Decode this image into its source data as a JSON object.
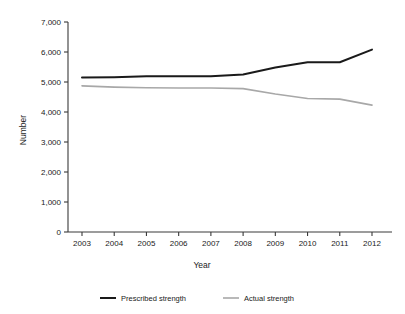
{
  "chart_data": {
    "type": "line",
    "title": "",
    "xlabel": "Year",
    "ylabel": "Number",
    "categories": [
      "2003",
      "2004",
      "2005",
      "2006",
      "2007",
      "2008",
      "2009",
      "2010",
      "2011",
      "2012"
    ],
    "x": [
      2003,
      2004,
      2005,
      2006,
      2007,
      2008,
      2009,
      2010,
      2011,
      2012
    ],
    "xlim": [
      2003,
      2012
    ],
    "ylim": [
      0,
      7000
    ],
    "yticks": [
      0,
      1000,
      2000,
      3000,
      4000,
      5000,
      6000,
      7000
    ],
    "ytick_labels": [
      "0",
      "1,000",
      "2,000",
      "3,000",
      "4,000",
      "5,000",
      "6,000",
      "7,000"
    ],
    "grid": false,
    "legend_position": "bottom-center",
    "series": [
      {
        "name": "Prescribed strength",
        "color": "#1a1a1a",
        "line_width": 2.0,
        "values": [
          5150,
          5160,
          5190,
          5190,
          5190,
          5250,
          5480,
          5660,
          5660,
          6080
        ]
      },
      {
        "name": "Actual strength",
        "color": "#a8a8a8",
        "line_width": 1.6,
        "values": [
          4870,
          4830,
          4810,
          4800,
          4800,
          4780,
          4600,
          4450,
          4430,
          4230
        ]
      }
    ]
  },
  "axes": {
    "y_title": "Number",
    "x_title": "Year"
  },
  "legend": {
    "items": [
      {
        "label": "Prescribed strength",
        "color": "#1a1a1a"
      },
      {
        "label": "Actual strength",
        "color": "#a8a8a8"
      }
    ]
  }
}
